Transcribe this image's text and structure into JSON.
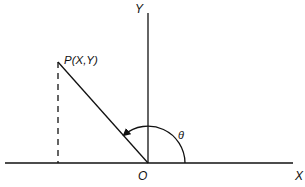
{
  "diagram": {
    "title": "",
    "axes": {
      "x_label": "X",
      "y_label": "Y",
      "origin_label": "O"
    },
    "point": {
      "label": "P(X,Y)"
    },
    "angle": {
      "label": "θ"
    },
    "colors": {
      "stroke": "#111111",
      "background": "#ffffff"
    }
  }
}
